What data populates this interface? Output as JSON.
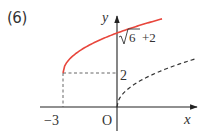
{
  "problem": {
    "number": "(6)"
  },
  "axes": {
    "x_label": "x",
    "y_label": "y",
    "origin_label": "O"
  },
  "ticks": {
    "x_neg3": "−3",
    "y_2": "2",
    "sqrt_symbol": "√",
    "sqrt_radicand": "6",
    "sqrt_suffix": "+2"
  },
  "curves": {
    "main": {
      "description": "y = √(x+3) + 2, x ≥ −3",
      "color": "#e8463c",
      "start": [
        -3,
        2
      ]
    },
    "reference": {
      "description": "y = √x (dashed)",
      "color": "#333333"
    }
  },
  "colors": {
    "axis": "#222222",
    "guide": "#555555",
    "curve": "#e8463c"
  }
}
